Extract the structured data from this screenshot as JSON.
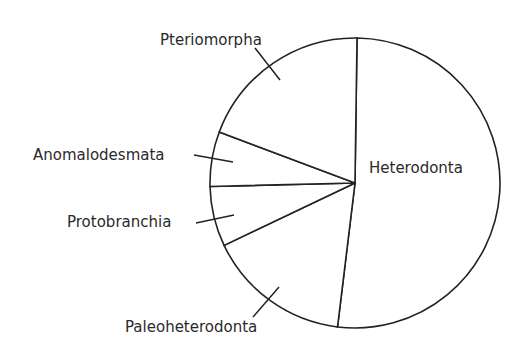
{
  "chart_data": {
    "type": "pie",
    "title": "",
    "start_angle_deg": 0,
    "direction": "clockwise",
    "categories": [
      "Heterodonta",
      "Paleoheterodonta",
      "Protobranchia",
      "Anomalodesmata",
      "Pteriomorpha"
    ],
    "values": [
      51.7,
      16.0,
      6.7,
      6.1,
      19.5
    ],
    "units": "percent (estimated from slice angles)",
    "labels_inside": [
      "Heterodonta"
    ],
    "labels_outside_with_leader": [
      "Pteriomorpha",
      "Anomalodesmata",
      "Protobranchia",
      "Paleoheterodonta"
    ],
    "legend": "none",
    "fill": "#ffffff",
    "stroke": "#222222"
  },
  "labels": {
    "heterodonta": "Heterodonta",
    "paleoheterodonta": "Paleoheterodonta",
    "protobranchia": "Protobranchia",
    "anomalodesmata": "Anomalodesmata",
    "pteriomorpha": "Pteriomorpha"
  }
}
